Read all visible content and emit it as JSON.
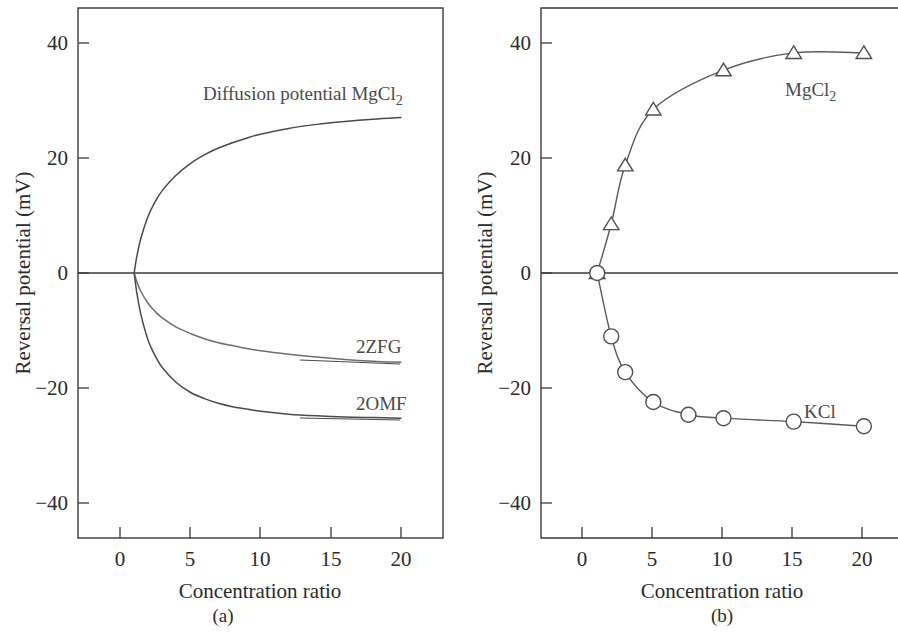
{
  "figure": {
    "panels": [
      {
        "id": "a",
        "caption": "(a)",
        "xlabel": "Concentration ratio",
        "ylabel": "Reversal potential (mV)",
        "xticks": [
          "0",
          "5",
          "10",
          "15",
          "20"
        ],
        "yticks": [
          "40",
          "20",
          "0",
          "−20",
          "−40"
        ],
        "annotations": {
          "diffusion": "Diffusion potential MgCl",
          "diffusion_sub": "2",
          "curve_zfg": "2ZFG",
          "curve_omf": "2OMF"
        }
      },
      {
        "id": "b",
        "caption": "(b)",
        "xlabel": "Concentration ratio",
        "ylabel": "Reversal potential (mV)",
        "xticks": [
          "0",
          "5",
          "10",
          "15",
          "20"
        ],
        "yticks": [
          "40",
          "20",
          "0",
          "−20",
          "−40"
        ],
        "annotations": {
          "mgcl2": "MgCl",
          "mgcl2_sub": "2",
          "kcl": "KCl"
        }
      }
    ]
  },
  "chart_data": [
    {
      "type": "line",
      "panel": "a",
      "title": "",
      "xlabel": "Concentration ratio",
      "ylabel": "Reversal potential (mV)",
      "xlim": [
        -3,
        23
      ],
      "ylim": [
        -46,
        46
      ],
      "xticks": [
        0,
        5,
        10,
        15,
        20
      ],
      "yticks": [
        40,
        20,
        0,
        -20,
        -40
      ],
      "grid": false,
      "legend_position": "inline-labels",
      "series": [
        {
          "name": "Diffusion potential MgCl2",
          "color": "#4a4a4a",
          "x": [
            1,
            1.2,
            1.5,
            2,
            2.5,
            3,
            4,
            5,
            6,
            7,
            8,
            9,
            10,
            12,
            14,
            16,
            18,
            20
          ],
          "y": [
            0,
            3.0,
            6.2,
            9.9,
            12.4,
            14.3,
            17.0,
            19.0,
            20.5,
            21.7,
            22.6,
            23.4,
            24.1,
            25.1,
            25.8,
            26.3,
            26.7,
            27.0
          ]
        },
        {
          "name": "2ZFG",
          "color": "#6e6e6e",
          "x": [
            1,
            1.2,
            1.5,
            2,
            2.5,
            3,
            4,
            5,
            6,
            7,
            8,
            9,
            10,
            12,
            14,
            16,
            18,
            20
          ],
          "y": [
            0,
            -1.6,
            -3.3,
            -5.3,
            -6.7,
            -7.8,
            -9.4,
            -10.5,
            -11.4,
            -12.1,
            -12.6,
            -13.1,
            -13.5,
            -14.1,
            -14.6,
            -15.0,
            -15.3,
            -15.5
          ]
        },
        {
          "name": "2OMF",
          "color": "#4a4a4a",
          "x": [
            1,
            1.2,
            1.5,
            2,
            2.5,
            3,
            4,
            5,
            6,
            7,
            8,
            9,
            10,
            12,
            14,
            16,
            18,
            20
          ],
          "y": [
            0,
            -3.6,
            -7.4,
            -11.7,
            -14.4,
            -16.4,
            -19.0,
            -20.7,
            -21.8,
            -22.6,
            -23.2,
            -23.6,
            -24.0,
            -24.5,
            -24.8,
            -25.0,
            -25.1,
            -25.2
          ]
        }
      ]
    },
    {
      "type": "line",
      "panel": "b",
      "title": "",
      "xlabel": "Concentration ratio",
      "ylabel": "Reversal potential (mV)",
      "xlim": [
        -3,
        23
      ],
      "ylim": [
        -46,
        46
      ],
      "xticks": [
        0,
        5,
        10,
        15,
        20
      ],
      "yticks": [
        40,
        20,
        0,
        -20,
        -40
      ],
      "grid": false,
      "legend_position": "inline-labels",
      "series": [
        {
          "name": "MgCl2",
          "marker": "triangle",
          "color": "#5a5a5a",
          "x": [
            1,
            2,
            3,
            5,
            10,
            15,
            20
          ],
          "y": [
            0,
            8.5,
            18.7,
            28.4,
            35.2,
            38.2,
            38.2
          ]
        },
        {
          "name": "KCl",
          "marker": "circle",
          "color": "#5a5a5a",
          "x": [
            1,
            2,
            3,
            5,
            7.5,
            10,
            15,
            20
          ],
          "y": [
            0,
            -11.0,
            -17.2,
            -22.4,
            -24.6,
            -25.2,
            -25.8,
            -26.6
          ]
        }
      ]
    }
  ]
}
